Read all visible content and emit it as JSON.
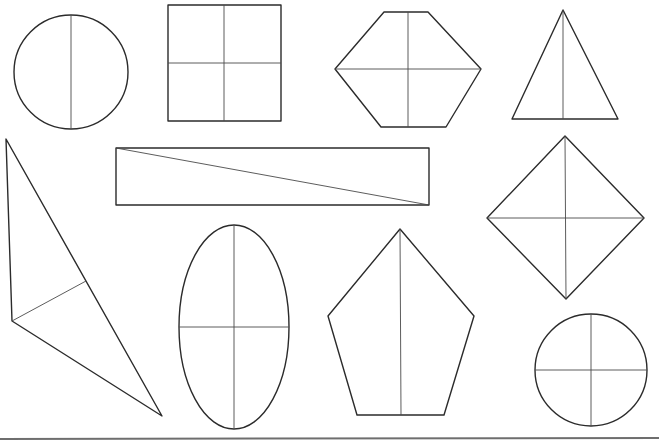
{
  "worksheet": {
    "title": "",
    "colors": {
      "stroke": "#2b2b2b",
      "divider": "#4a4a4a",
      "background": "#ffffff",
      "baseline": "#6e6e6e"
    },
    "shapes": [
      {
        "id": "circle-top-left",
        "type": "circle",
        "cx": 71,
        "cy": 72,
        "r": 57,
        "dividers": [
          "vertical"
        ],
        "parts": 2
      },
      {
        "id": "square",
        "type": "rect",
        "x": 168,
        "y": 5,
        "w": 113,
        "h": 116,
        "dividers": [
          "vertical",
          "horizontal"
        ],
        "parts": 4
      },
      {
        "id": "hexagon",
        "type": "polygon",
        "points": "384,12 428,12 481,69 446,127 381,127 335,69",
        "dividers": [
          "vertical",
          "horizontal"
        ],
        "parts": 4
      },
      {
        "id": "triangle-isosceles",
        "type": "polygon",
        "points": "563,10 618,119 512,119",
        "dividers": [
          "vertical"
        ],
        "parts": 2
      },
      {
        "id": "triangle-scalene",
        "type": "polygon",
        "points": "6,139 162,416 12,321",
        "dividers": [
          "median"
        ],
        "parts": 2
      },
      {
        "id": "long-rectangle",
        "type": "rect",
        "x": 116,
        "y": 148,
        "w": 313,
        "h": 57,
        "dividers": [
          "diagonal"
        ],
        "parts": 2
      },
      {
        "id": "diamond",
        "type": "polygon",
        "points": "565,136 644,218 566,299 487,218",
        "dividers": [
          "vertical",
          "horizontal"
        ],
        "parts": 4
      },
      {
        "id": "ellipse",
        "type": "ellipse",
        "cx": 234,
        "cy": 327,
        "rx": 55,
        "ry": 102,
        "dividers": [
          "vertical",
          "horizontal"
        ],
        "parts": 4
      },
      {
        "id": "pentagon",
        "type": "polygon",
        "points": "400,229 474,316 444,415 357,415 328,316",
        "dividers": [
          "vertical"
        ],
        "parts": 2
      },
      {
        "id": "circle-bottom-right",
        "type": "circle",
        "cx": 591,
        "cy": 370,
        "r": 56,
        "dividers": [
          "vertical",
          "horizontal"
        ],
        "parts": 4
      }
    ]
  }
}
